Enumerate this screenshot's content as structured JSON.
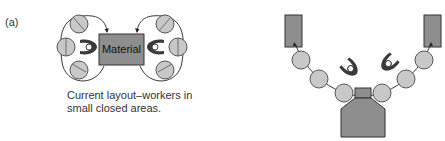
{
  "figure": {
    "panel_label": "(a)",
    "left_diagram": {
      "material_label": "Material",
      "caption_line1": "Current layout–workers in",
      "caption_line2": "small closed areas.",
      "station_count": 6,
      "worker_count": 2
    },
    "right_diagram": {
      "station_count": 6,
      "worker_count": 2,
      "material_bins": 2
    },
    "colors": {
      "station_fill": "#c8c8c8",
      "box_fill": "#8e8e8e",
      "worker_fill": "#3a3a3a"
    }
  }
}
